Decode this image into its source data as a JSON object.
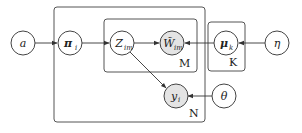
{
  "diagram": {
    "type": "plate-notation graphical model",
    "plates": [
      {
        "id": "N",
        "label": "N"
      },
      {
        "id": "M",
        "label": "M"
      },
      {
        "id": "K",
        "label": "K"
      }
    ],
    "nodes": {
      "a": {
        "symbol": "a",
        "sub": "",
        "observed": false
      },
      "pi": {
        "symbol": "π",
        "sub": "i",
        "observed": false
      },
      "z": {
        "symbol": "Z",
        "sub": "im",
        "observed": false
      },
      "w": {
        "symbol": "W̃",
        "sub": "im",
        "observed": true
      },
      "mu": {
        "symbol": "μ",
        "sub": "k",
        "observed": false
      },
      "eta": {
        "symbol": "η",
        "sub": "",
        "observed": false
      },
      "y": {
        "symbol": "y",
        "sub": "i",
        "observed": true
      },
      "theta": {
        "symbol": "θ",
        "sub": "",
        "observed": false
      }
    },
    "edges": [
      [
        "a",
        "pi"
      ],
      [
        "pi",
        "z"
      ],
      [
        "z",
        "w"
      ],
      [
        "mu",
        "w"
      ],
      [
        "eta",
        "mu"
      ],
      [
        "z",
        "y"
      ],
      [
        "theta",
        "y"
      ]
    ]
  }
}
